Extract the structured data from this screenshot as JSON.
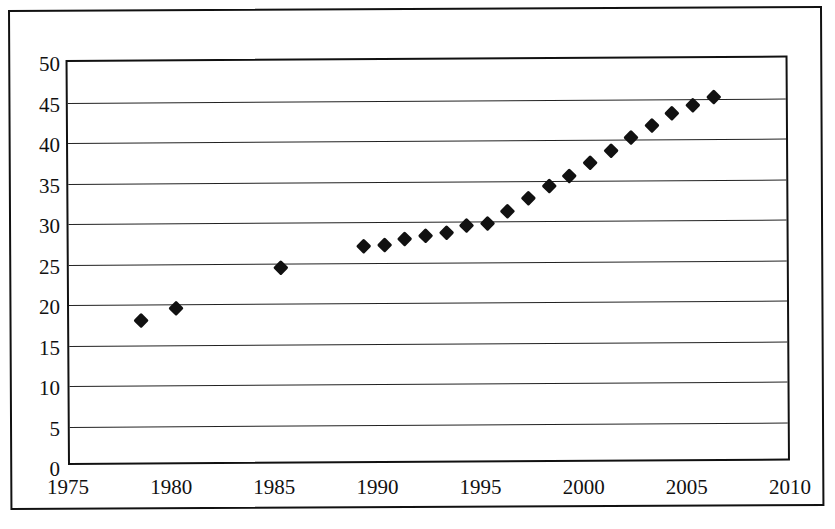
{
  "chart_data": {
    "type": "scatter",
    "title": "",
    "xlabel": "",
    "ylabel": "",
    "xlim": [
      1975,
      2010
    ],
    "ylim": [
      0,
      50
    ],
    "grid": true,
    "legend": false,
    "marker": "diamond",
    "marker_color": "#111111",
    "x_ticks": [
      1975,
      1980,
      1985,
      1990,
      1995,
      2000,
      2005,
      2010
    ],
    "y_ticks": [
      0,
      5,
      10,
      15,
      20,
      25,
      30,
      35,
      40,
      45,
      50
    ],
    "x": [
      1978.5,
      1980.2,
      1985.3,
      1989.3,
      1990.3,
      1991.3,
      1992.3,
      1993.3,
      1994.3,
      1995.3,
      1996.3,
      1997.3,
      1998.3,
      1999.3,
      2000.3,
      2001.3,
      2002.3,
      2003.3,
      2004.3,
      2005.3,
      2006.3
    ],
    "y": [
      18.0,
      19.5,
      24.4,
      27.0,
      27.2,
      27.9,
      28.3,
      28.7,
      29.5,
      29.8,
      31.2,
      32.8,
      34.3,
      35.6,
      37.2,
      38.6,
      40.2,
      41.7,
      43.2,
      44.2,
      45.2
    ],
    "points": [
      {
        "x": 1978.5,
        "y": 18.0
      },
      {
        "x": 1980.2,
        "y": 19.5
      },
      {
        "x": 1985.3,
        "y": 24.4
      },
      {
        "x": 1989.3,
        "y": 27.0
      },
      {
        "x": 1990.3,
        "y": 27.2
      },
      {
        "x": 1991.3,
        "y": 27.9
      },
      {
        "x": 1992.3,
        "y": 28.3
      },
      {
        "x": 1993.3,
        "y": 28.7
      },
      {
        "x": 1994.3,
        "y": 29.5
      },
      {
        "x": 1995.3,
        "y": 29.8
      },
      {
        "x": 1996.3,
        "y": 31.2
      },
      {
        "x": 1997.3,
        "y": 32.8
      },
      {
        "x": 1998.3,
        "y": 34.3
      },
      {
        "x": 1999.3,
        "y": 35.6
      },
      {
        "x": 2000.3,
        "y": 37.2
      },
      {
        "x": 2001.3,
        "y": 38.6
      },
      {
        "x": 2002.3,
        "y": 40.2
      },
      {
        "x": 2003.3,
        "y": 41.7
      },
      {
        "x": 2004.3,
        "y": 43.2
      },
      {
        "x": 2005.3,
        "y": 44.2
      },
      {
        "x": 2006.3,
        "y": 45.2
      }
    ]
  }
}
